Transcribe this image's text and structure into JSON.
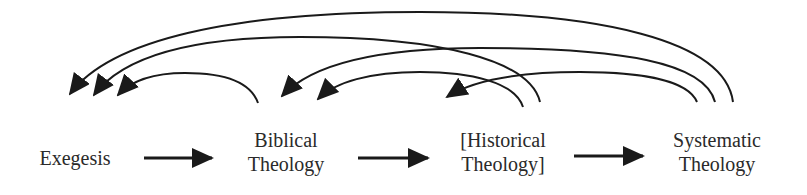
{
  "diagram": {
    "type": "flow",
    "stroke_color": "#1a1a1a",
    "text_color": "#2a2a2a",
    "nodes": [
      {
        "id": "exegesis",
        "lines": [
          "Exegesis"
        ]
      },
      {
        "id": "biblical",
        "lines": [
          "Biblical",
          "Theology"
        ]
      },
      {
        "id": "historical",
        "lines": [
          "[Historical",
          "Theology]"
        ]
      },
      {
        "id": "systematic",
        "lines": [
          "Systematic",
          "Theology"
        ]
      }
    ],
    "forward_edges": [
      {
        "from": "exegesis",
        "to": "biblical"
      },
      {
        "from": "biblical",
        "to": "historical"
      },
      {
        "from": "historical",
        "to": "systematic"
      }
    ],
    "feedback_edges": [
      {
        "from": "systematic",
        "to": "exegesis"
      },
      {
        "from": "historical",
        "to": "exegesis"
      },
      {
        "from": "biblical",
        "to": "exegesis"
      },
      {
        "from": "systematic",
        "to": "biblical"
      },
      {
        "from": "historical",
        "to": "biblical"
      },
      {
        "from": "systematic",
        "to": "historical"
      }
    ]
  }
}
